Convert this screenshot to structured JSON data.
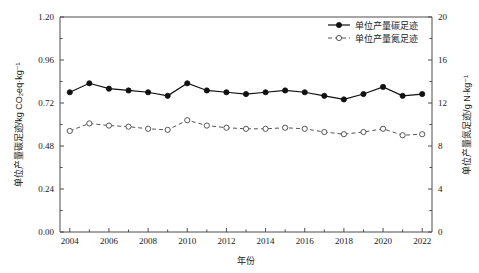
{
  "chart_data": {
    "type": "line",
    "title": "",
    "xlabel": "年份",
    "ylabel": "单位产量碳足迹/kg CO₂eq·kg⁻¹",
    "y2label": "单位产量氮足迹/g N·kg⁻¹",
    "grid": false,
    "legend_position": "top-right",
    "xlim": [
      2003.5,
      2022.5
    ],
    "ylim": [
      0.0,
      1.2
    ],
    "y2lim": [
      0,
      20
    ],
    "x": [
      2004,
      2005,
      2006,
      2007,
      2008,
      2009,
      2010,
      2011,
      2012,
      2013,
      2014,
      2015,
      2016,
      2017,
      2018,
      2019,
      2020,
      2021,
      2022
    ],
    "xticklabels": [
      "2004",
      "2006",
      "2008",
      "2010",
      "2012",
      "2014",
      "2016",
      "2018",
      "2020",
      "2022"
    ],
    "xticks": [
      2004,
      2006,
      2008,
      2010,
      2012,
      2014,
      2016,
      2018,
      2020,
      2022
    ],
    "yticks": [
      0.0,
      0.24,
      0.48,
      0.72,
      0.96,
      1.2
    ],
    "yticklabels": [
      "0.00",
      "0.24",
      "0.48",
      "0.72",
      "0.96",
      "1.20"
    ],
    "y2ticks": [
      0,
      4,
      8,
      12,
      16,
      20
    ],
    "y2ticklabels": [
      "0",
      "4",
      "8",
      "12",
      "16",
      "20"
    ],
    "series": [
      {
        "name": "单位产量碳足迹",
        "axis": "left",
        "style": "solid",
        "marker": "filled-circle",
        "color": "#111111",
        "values": [
          0.78,
          0.83,
          0.8,
          0.79,
          0.78,
          0.76,
          0.83,
          0.79,
          0.78,
          0.77,
          0.78,
          0.79,
          0.78,
          0.76,
          0.74,
          0.77,
          0.81,
          0.76,
          0.77
        ]
      },
      {
        "name": "单位产量氮足迹",
        "axis": "right",
        "style": "dashed",
        "marker": "open-circle",
        "color": "#555555",
        "values": [
          9.4,
          10.1,
          9.9,
          9.8,
          9.6,
          9.5,
          10.4,
          9.9,
          9.7,
          9.6,
          9.6,
          9.7,
          9.6,
          9.3,
          9.1,
          9.3,
          9.6,
          9.0,
          9.1
        ]
      }
    ]
  },
  "legend": {
    "items": [
      {
        "label": "单位产量碳足迹",
        "marker": "filled-circle",
        "style": "solid"
      },
      {
        "label": "单位产量氮足迹",
        "marker": "open-circle",
        "style": "dashed"
      }
    ]
  },
  "axes": {
    "x_title": "年份",
    "y_left_title": "单位产量碳足迹/kg CO₂eq·kg⁻¹",
    "y_right_title": "单位产量氮足迹/g N·kg⁻¹"
  }
}
